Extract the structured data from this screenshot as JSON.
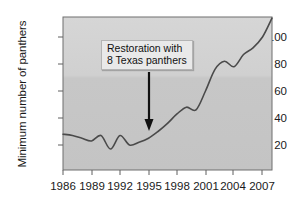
{
  "chart_data": {
    "type": "line",
    "title": "",
    "xlabel": "",
    "ylabel": "Minimum number of panthers",
    "xlim": [
      1986,
      2008
    ],
    "ylim": [
      0,
      120
    ],
    "xticks": [
      1986,
      1989,
      1992,
      1995,
      1998,
      2001,
      2004,
      2007
    ],
    "xtick_labels": [
      "1986",
      "1989",
      "1992",
      "1995",
      "1998",
      "2001",
      "2004",
      "2007"
    ],
    "yticks": [
      20,
      40,
      60,
      80,
      100
    ],
    "ytick_labels": [
      "20",
      "40",
      "60",
      "80",
      "100"
    ],
    "grid": false,
    "legend": false,
    "series": [
      {
        "name": "Minimum number of panthers",
        "color": "#4a4a4a",
        "x": [
          1986,
          1987,
          1988,
          1989,
          1990,
          1991,
          1992,
          1993,
          1994,
          1995,
          1996,
          1997,
          1998,
          1999,
          2000,
          2001,
          2002,
          2003,
          2004,
          2005,
          2006,
          2007,
          2008
        ],
        "values": [
          28,
          27,
          25,
          23,
          27,
          17,
          27,
          20,
          22,
          25,
          30,
          36,
          43,
          48,
          46,
          60,
          76,
          82,
          78,
          87,
          92,
          100,
          114
        ]
      }
    ],
    "annotations": [
      {
        "name": "restoration-annotation",
        "line1": "Restoration with",
        "line2": "8 Texas panthers",
        "arrow_year": 1995,
        "arrow_points_to": 30
      }
    ],
    "colors": {
      "plot_background": "#c9c9c9",
      "plot_background_upper": "#d2d2d2",
      "line": "#4a4a4a",
      "axis": "#6a6a6a",
      "text": "#1a1a1a",
      "annotation_fill": "#e9e9e9",
      "annotation_border": "#b4b4b4"
    }
  }
}
